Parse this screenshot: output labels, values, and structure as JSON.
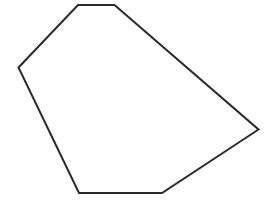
{
  "canvas": {
    "width": 271,
    "height": 201,
    "background": "#ffffff"
  },
  "shape": {
    "type": "hexagon",
    "vertex_count": 6,
    "stroke": "#2a2a2a",
    "stroke_width": 2,
    "fill": "#ffffff",
    "points": "78,5 114.5,5 258.5,129.5 162,193 79,193 18.5,67.5",
    "vertices": [
      {
        "x": 78,
        "y": 5
      },
      {
        "x": 114.5,
        "y": 5
      },
      {
        "x": 258.5,
        "y": 129.5
      },
      {
        "x": 162,
        "y": 193
      },
      {
        "x": 79,
        "y": 193
      },
      {
        "x": 18.5,
        "y": 67.5
      }
    ]
  }
}
